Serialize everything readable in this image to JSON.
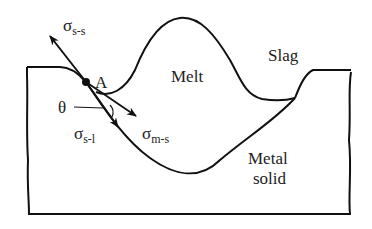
{
  "diagram": {
    "type": "wetting-equilibrium-schematic",
    "regions": {
      "melt": "Melt",
      "slag": "Slag",
      "metal_solid_line1": "Metal",
      "metal_solid_line2": "solid"
    },
    "point": {
      "label": "A"
    },
    "angle": {
      "label": "θ"
    },
    "tensions": {
      "solid_slag": {
        "symbol": "σ",
        "subscript": "s-s"
      },
      "solid_liquid": {
        "symbol": "σ",
        "subscript": "s-l"
      },
      "melt_solid": {
        "symbol": "σ",
        "subscript": "m-s"
      }
    },
    "colors": {
      "line": "#111111",
      "background": "#ffffff"
    }
  }
}
